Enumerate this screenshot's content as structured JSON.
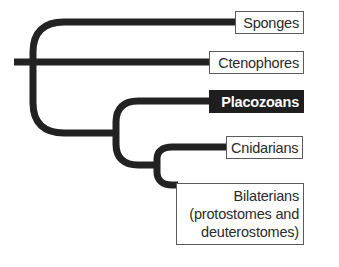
{
  "diagram": {
    "type": "phylogenetic-tree",
    "line_color": "#222222",
    "highlight_color": "#1e1e1e",
    "taxa": [
      {
        "id": "sponges",
        "label": "Sponges",
        "highlighted": false
      },
      {
        "id": "ctenophores",
        "label": "Ctenophores",
        "highlighted": false
      },
      {
        "id": "placozoans",
        "label": "Placozoans",
        "highlighted": true
      },
      {
        "id": "cnidarians",
        "label": "Cnidarians",
        "highlighted": false
      },
      {
        "id": "bilaterians",
        "label": "Bilaterians (protostomes and deuterostomes)",
        "lines": [
          "Bilaterians",
          "(protostomes and",
          "deuterostomes)"
        ],
        "highlighted": false
      }
    ],
    "topology": "((Sponges, Ctenophores), (Placozoans, (Cnidarians, Bilaterians)))"
  }
}
